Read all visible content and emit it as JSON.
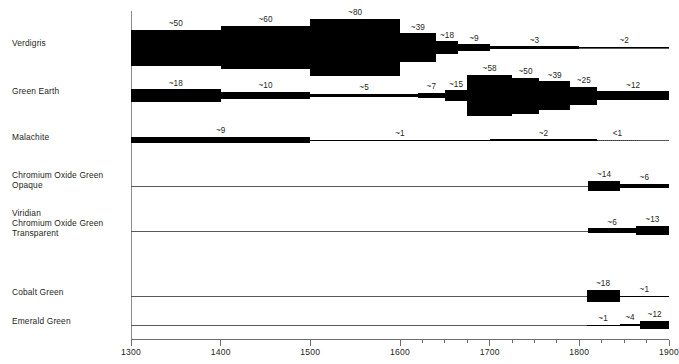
{
  "chart_data": {
    "type": "bar",
    "title": "",
    "subtitle": "",
    "xlabel": "",
    "ylabel": "",
    "xlim": [
      1300,
      1900
    ],
    "grid": false,
    "legend_position": "none",
    "axis": {
      "major_ticks": [
        1300,
        1400,
        1500,
        1600,
        1700,
        1800,
        1900
      ],
      "major_tick_labels": [
        "1300",
        "1400",
        "1500",
        "1600",
        "1700",
        "1800",
        "1900"
      ],
      "minor_tick_interval": 25,
      "minor_ticks_start": 1600,
      "minor_ticks_end": 1900
    },
    "value_prefix_approx": "~",
    "value_prefix_less": "<",
    "series": [
      {
        "name": "Verdigris",
        "label_lines": [
          "Verdigris"
        ],
        "segments": [
          {
            "start": 1300,
            "end": 1400,
            "value": 50,
            "label": "~50",
            "kind": "approx"
          },
          {
            "start": 1400,
            "end": 1500,
            "value": 60,
            "label": "~60",
            "kind": "approx"
          },
          {
            "start": 1500,
            "end": 1600,
            "value": 80,
            "label": "~80",
            "kind": "approx"
          },
          {
            "start": 1600,
            "end": 1640,
            "value": 39,
            "label": "~39",
            "kind": "approx"
          },
          {
            "start": 1640,
            "end": 1665,
            "value": 18,
            "label": "~18",
            "kind": "approx"
          },
          {
            "start": 1665,
            "end": 1700,
            "value": 9,
            "label": "~9",
            "kind": "approx"
          },
          {
            "start": 1700,
            "end": 1800,
            "value": 3,
            "label": "~3",
            "kind": "approx"
          },
          {
            "start": 1800,
            "end": 1900,
            "value": 2,
            "label": "~2",
            "kind": "approx"
          }
        ]
      },
      {
        "name": "Green Earth",
        "label_lines": [
          "Green Earth"
        ],
        "segments": [
          {
            "start": 1300,
            "end": 1400,
            "value": 18,
            "label": "~18",
            "kind": "approx"
          },
          {
            "start": 1400,
            "end": 1500,
            "value": 10,
            "label": "~10",
            "kind": "approx"
          },
          {
            "start": 1500,
            "end": 1620,
            "value": 5,
            "label": "~5",
            "kind": "approx"
          },
          {
            "start": 1620,
            "end": 1650,
            "value": 7,
            "label": "~7",
            "kind": "approx"
          },
          {
            "start": 1650,
            "end": 1675,
            "value": 15,
            "label": "~15",
            "kind": "approx"
          },
          {
            "start": 1675,
            "end": 1725,
            "value": 58,
            "label": "~58",
            "kind": "approx"
          },
          {
            "start": 1725,
            "end": 1755,
            "value": 50,
            "label": "~50",
            "kind": "approx"
          },
          {
            "start": 1755,
            "end": 1790,
            "value": 39,
            "label": "~39",
            "kind": "approx"
          },
          {
            "start": 1790,
            "end": 1820,
            "value": 25,
            "label": "~25",
            "kind": "approx"
          },
          {
            "start": 1820,
            "end": 1900,
            "value": 12,
            "label": "~12",
            "kind": "approx"
          }
        ]
      },
      {
        "name": "Malachite",
        "label_lines": [
          "Malachite"
        ],
        "segments": [
          {
            "start": 1300,
            "end": 1500,
            "value": 9,
            "label": "~9",
            "kind": "approx"
          },
          {
            "start": 1500,
            "end": 1700,
            "value": 1,
            "label": "~1",
            "kind": "approx"
          },
          {
            "start": 1700,
            "end": 1820,
            "value": 2,
            "label": "~2",
            "kind": "approx"
          },
          {
            "start": 1820,
            "end": 1865,
            "value": 0.4,
            "label": "<1",
            "kind": "dotted"
          }
        ]
      },
      {
        "name": "Chromium Oxide Green Opaque",
        "label_lines": [
          "Chromium Oxide Green",
          "Opaque"
        ],
        "segments": [
          {
            "start": 1810,
            "end": 1845,
            "value": 14,
            "label": "~14",
            "kind": "approx"
          },
          {
            "start": 1845,
            "end": 1900,
            "value": 6,
            "label": "~6",
            "kind": "approx"
          }
        ]
      },
      {
        "name": "Viridian Chromium Oxide Green Transparent",
        "label_lines": [
          "Viridian",
          "Chromium Oxide Green",
          "Transparent"
        ],
        "segments": [
          {
            "start": 1810,
            "end": 1863,
            "value": 6,
            "label": "~6",
            "kind": "approx"
          },
          {
            "start": 1863,
            "end": 1900,
            "value": 13,
            "label": "~13",
            "kind": "approx"
          }
        ]
      },
      {
        "name": "Cobalt Green",
        "label_lines": [
          "Cobalt Green"
        ],
        "segments": [
          {
            "start": 1808,
            "end": 1845,
            "value": 18,
            "label": "~18",
            "kind": "approx"
          },
          {
            "start": 1845,
            "end": 1900,
            "value": 1,
            "label": "~1",
            "kind": "approx"
          }
        ]
      },
      {
        "name": "Emerald Green",
        "label_lines": [
          "Emerald Green"
        ],
        "segments": [
          {
            "start": 1808,
            "end": 1845,
            "value": 1,
            "label": "~1",
            "kind": "approx"
          },
          {
            "start": 1845,
            "end": 1868,
            "value": 4,
            "label": "~4",
            "kind": "approx"
          },
          {
            "start": 1868,
            "end": 1900,
            "value": 12,
            "label": "~12",
            "kind": "approx"
          }
        ]
      }
    ]
  },
  "colors": {
    "bar": "#000000",
    "axis": "#6d6d6d",
    "text": "#231f20",
    "background": "#ffffff"
  }
}
